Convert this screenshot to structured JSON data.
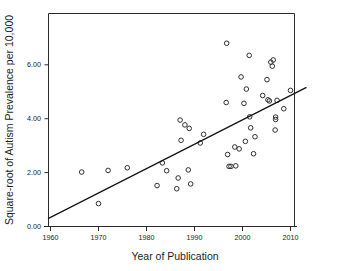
{
  "chart_data": {
    "type": "scatter",
    "title": "",
    "subtitle": "",
    "xlabel": "Year of Publication",
    "ylabel": "Square-root of Autism Prevalence per 10,000",
    "xlim": [
      1958,
      2013.5
    ],
    "ylim": [
      0.0,
      7.3
    ],
    "xticks": [
      1960,
      1970,
      1980,
      1990,
      2000,
      2010
    ],
    "xticklabels": [
      "1960",
      "1970",
      "1980",
      "1990",
      "2000",
      "2010"
    ],
    "yticks": [
      0.0,
      2.0,
      4.0,
      6.0
    ],
    "yticklabels": [
      "0.00",
      "2.00",
      "4.00",
      "6.00"
    ],
    "grid": false,
    "legend": null,
    "marker": "open-circle",
    "marker_color": "#2f2f2f",
    "points": [
      {
        "x": 1966.5,
        "y": 2.02
      },
      {
        "x": 1970.0,
        "y": 0.85
      },
      {
        "x": 1972.0,
        "y": 2.08
      },
      {
        "x": 1976.0,
        "y": 2.18
      },
      {
        "x": 1982.2,
        "y": 1.52
      },
      {
        "x": 1983.3,
        "y": 2.36
      },
      {
        "x": 1984.2,
        "y": 2.07
      },
      {
        "x": 1986.3,
        "y": 1.4
      },
      {
        "x": 1986.6,
        "y": 1.8
      },
      {
        "x": 1987.0,
        "y": 3.95
      },
      {
        "x": 1987.2,
        "y": 3.2
      },
      {
        "x": 1988.0,
        "y": 3.77
      },
      {
        "x": 1988.7,
        "y": 2.1
      },
      {
        "x": 1988.9,
        "y": 3.64
      },
      {
        "x": 1989.2,
        "y": 1.58
      },
      {
        "x": 1991.2,
        "y": 3.1
      },
      {
        "x": 1991.9,
        "y": 3.42
      },
      {
        "x": 1996.7,
        "y": 6.8
      },
      {
        "x": 1996.6,
        "y": 4.6
      },
      {
        "x": 1996.9,
        "y": 2.67
      },
      {
        "x": 1997.2,
        "y": 2.23
      },
      {
        "x": 1997.6,
        "y": 2.23
      },
      {
        "x": 1998.4,
        "y": 2.95
      },
      {
        "x": 1998.6,
        "y": 2.25
      },
      {
        "x": 1999.3,
        "y": 2.88
      },
      {
        "x": 1999.7,
        "y": 5.55
      },
      {
        "x": 2000.3,
        "y": 4.57
      },
      {
        "x": 2000.6,
        "y": 3.16
      },
      {
        "x": 2000.8,
        "y": 5.1
      },
      {
        "x": 2001.4,
        "y": 6.35
      },
      {
        "x": 2001.5,
        "y": 4.07
      },
      {
        "x": 2001.7,
        "y": 3.66
      },
      {
        "x": 2002.3,
        "y": 2.7
      },
      {
        "x": 2002.6,
        "y": 3.33
      },
      {
        "x": 2004.2,
        "y": 4.86
      },
      {
        "x": 2005.1,
        "y": 5.45
      },
      {
        "x": 2005.3,
        "y": 4.7
      },
      {
        "x": 2005.6,
        "y": 4.66
      },
      {
        "x": 2005.9,
        "y": 6.1
      },
      {
        "x": 2006.4,
        "y": 6.18
      },
      {
        "x": 2006.2,
        "y": 5.95
      },
      {
        "x": 2006.8,
        "y": 3.58
      },
      {
        "x": 2006.9,
        "y": 4.06
      },
      {
        "x": 2006.9,
        "y": 3.97
      },
      {
        "x": 2007.2,
        "y": 4.68
      },
      {
        "x": 2008.6,
        "y": 4.37
      },
      {
        "x": 2010.0,
        "y": 5.05
      }
    ],
    "fit_line": {
      "type": "linear-regression",
      "x_start": 1959.6,
      "y_start": 0.3,
      "x_end": 2013.2,
      "y_end": 5.15
    }
  }
}
